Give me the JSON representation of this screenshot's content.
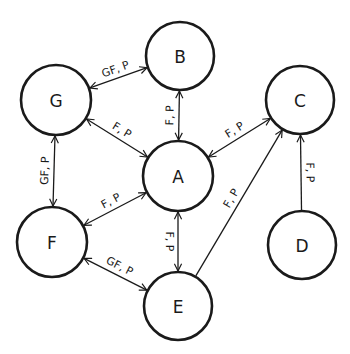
{
  "diagram": {
    "type": "directed-graph",
    "nodes": [
      {
        "id": "A",
        "label": "A",
        "cx": 178,
        "cy": 176,
        "r": 35
      },
      {
        "id": "B",
        "label": "B",
        "cx": 180,
        "cy": 56,
        "r": 34
      },
      {
        "id": "C",
        "label": "C",
        "cx": 300,
        "cy": 100,
        "r": 34
      },
      {
        "id": "D",
        "label": "D",
        "cx": 302,
        "cy": 245,
        "r": 34
      },
      {
        "id": "E",
        "label": "E",
        "cx": 178,
        "cy": 306,
        "r": 34
      },
      {
        "id": "F",
        "label": "F",
        "cx": 52,
        "cy": 242,
        "r": 35
      },
      {
        "id": "G",
        "label": "G",
        "cx": 56,
        "cy": 100,
        "r": 35
      }
    ],
    "edges": [
      {
        "from": "G",
        "to": "B",
        "label": "GF, P",
        "direction": "both"
      },
      {
        "from": "B",
        "to": "A",
        "label": "F, P",
        "direction": "both"
      },
      {
        "from": "G",
        "to": "A",
        "label": "F, P",
        "direction": "both"
      },
      {
        "from": "A",
        "to": "C",
        "label": "F, P",
        "direction": "both"
      },
      {
        "from": "G",
        "to": "F",
        "label": "GF, P",
        "direction": "both"
      },
      {
        "from": "F",
        "to": "A",
        "label": "F, P",
        "direction": "both"
      },
      {
        "from": "A",
        "to": "E",
        "label": "F, P",
        "direction": "both"
      },
      {
        "from": "F",
        "to": "E",
        "label": "GF, P",
        "direction": "both"
      },
      {
        "from": "E",
        "to": "C",
        "label": "F, P",
        "direction": "forward"
      },
      {
        "from": "D",
        "to": "C",
        "label": "F, P",
        "direction": "forward"
      }
    ]
  }
}
